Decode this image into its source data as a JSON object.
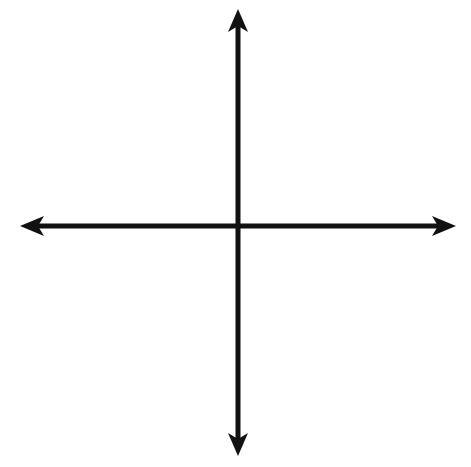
{
  "diagram": {
    "type": "coordinate-plane",
    "grid": {
      "columns": 12,
      "rows": 12,
      "x_range": [
        -6,
        6
      ],
      "y_range": [
        -6,
        6
      ]
    },
    "axes": {
      "x_axis": "horizontal with arrows both ends",
      "y_axis": "vertical with arrows both ends"
    },
    "points": [
      {
        "label": "P",
        "x": 5,
        "y": 0
      }
    ],
    "colors": {
      "grid": "#222222",
      "axes": "#111111",
      "point": "#111111",
      "background": "#ffffff"
    }
  }
}
